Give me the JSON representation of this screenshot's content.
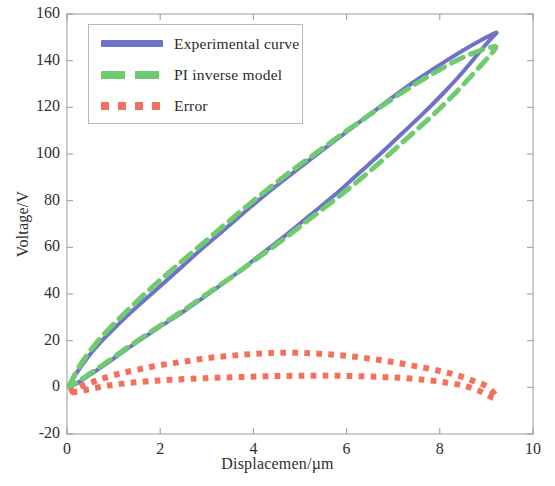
{
  "chart_data": {
    "type": "line",
    "title": "",
    "xlabel": "Displacemen/µm",
    "ylabel": "Voltage/V",
    "xlim": [
      0,
      10
    ],
    "ylim": [
      -20,
      160
    ],
    "xticks": [
      "0",
      "2",
      "4",
      "6",
      "8",
      "10"
    ],
    "xtick_values": [
      0,
      2,
      4,
      6,
      8,
      10
    ],
    "yticks": [
      "-20",
      "0",
      "20",
      "40",
      "60",
      "80",
      "100",
      "120",
      "140",
      "160"
    ],
    "ytick_values": [
      -20,
      0,
      20,
      40,
      60,
      80,
      100,
      120,
      140,
      160
    ],
    "grid": false,
    "legend_position": "upper left",
    "series": [
      {
        "name": "Experimental curve",
        "color": "#6E72C8",
        "style": "solid",
        "linewidth": 4,
        "points": [
          [
            0.05,
            0.5
          ],
          [
            0.2,
            6.0
          ],
          [
            0.45,
            13.0
          ],
          [
            0.75,
            20.0
          ],
          [
            1.1,
            27.0
          ],
          [
            1.5,
            34.5
          ],
          [
            1.95,
            42.5
          ],
          [
            2.4,
            50.5
          ],
          [
            2.9,
            59.5
          ],
          [
            3.4,
            68.0
          ],
          [
            3.95,
            77.5
          ],
          [
            4.5,
            86.5
          ],
          [
            5.05,
            95.0
          ],
          [
            5.6,
            103.5
          ],
          [
            6.1,
            111.0
          ],
          [
            6.6,
            118.5
          ],
          [
            7.1,
            126.0
          ],
          [
            7.6,
            133.0
          ],
          [
            8.1,
            139.5
          ],
          [
            8.55,
            145.0
          ],
          [
            8.9,
            149.0
          ],
          [
            9.15,
            151.5
          ],
          [
            9.22,
            152.0
          ],
          [
            9.15,
            150.5
          ],
          [
            8.95,
            146.0
          ],
          [
            8.7,
            140.0
          ],
          [
            8.4,
            133.0
          ],
          [
            8.05,
            125.5
          ],
          [
            7.65,
            117.5
          ],
          [
            7.2,
            109.0
          ],
          [
            6.75,
            100.5
          ],
          [
            6.25,
            91.5
          ],
          [
            5.75,
            82.5
          ],
          [
            5.2,
            73.5
          ],
          [
            4.65,
            64.5
          ],
          [
            4.1,
            56.0
          ],
          [
            3.55,
            47.5
          ],
          [
            3.0,
            39.5
          ],
          [
            2.5,
            32.5
          ],
          [
            2.0,
            26.0
          ],
          [
            1.55,
            20.0
          ],
          [
            1.15,
            14.5
          ],
          [
            0.8,
            9.5
          ],
          [
            0.5,
            5.5
          ],
          [
            0.28,
            2.5
          ],
          [
            0.12,
            0.8
          ],
          [
            0.05,
            0.2
          ]
        ]
      },
      {
        "name": "PI inverse model",
        "color": "#6FCB6F",
        "style": "dashed",
        "linewidth": 5,
        "points": [
          [
            0.05,
            0.8
          ],
          [
            0.25,
            8.5
          ],
          [
            0.55,
            17.0
          ],
          [
            0.9,
            25.0
          ],
          [
            1.3,
            33.0
          ],
          [
            1.75,
            41.5
          ],
          [
            2.2,
            49.5
          ],
          [
            2.7,
            58.0
          ],
          [
            3.2,
            66.5
          ],
          [
            3.7,
            75.0
          ],
          [
            4.25,
            84.0
          ],
          [
            4.8,
            92.5
          ],
          [
            5.35,
            100.5
          ],
          [
            5.9,
            108.5
          ],
          [
            6.4,
            115.5
          ],
          [
            6.9,
            122.5
          ],
          [
            7.4,
            129.0
          ],
          [
            7.9,
            135.0
          ],
          [
            8.35,
            140.0
          ],
          [
            8.75,
            143.5
          ],
          [
            9.05,
            145.5
          ],
          [
            9.2,
            146.0
          ],
          [
            9.15,
            144.0
          ],
          [
            8.95,
            139.5
          ],
          [
            8.7,
            134.0
          ],
          [
            8.4,
            127.5
          ],
          [
            8.05,
            120.5
          ],
          [
            7.65,
            113.0
          ],
          [
            7.2,
            105.0
          ],
          [
            6.75,
            97.0
          ],
          [
            6.25,
            88.5
          ],
          [
            5.75,
            80.5
          ],
          [
            5.2,
            72.0
          ],
          [
            4.65,
            63.5
          ],
          [
            4.1,
            55.5
          ],
          [
            3.55,
            47.5
          ],
          [
            3.0,
            40.0
          ],
          [
            2.5,
            33.0
          ],
          [
            2.0,
            26.5
          ],
          [
            1.55,
            20.5
          ],
          [
            1.15,
            15.0
          ],
          [
            0.8,
            10.0
          ],
          [
            0.5,
            6.0
          ],
          [
            0.28,
            3.0
          ],
          [
            0.12,
            1.0
          ],
          [
            0.05,
            0.3
          ]
        ]
      },
      {
        "name": "Error",
        "color": "#F4705A",
        "style": "dotted",
        "linewidth": 6,
        "points": [
          [
            0.05,
            -2.0
          ],
          [
            0.3,
            0.5
          ],
          [
            0.65,
            3.0
          ],
          [
            1.05,
            5.5
          ],
          [
            1.5,
            7.5
          ],
          [
            2.0,
            9.5
          ],
          [
            2.5,
            11.0
          ],
          [
            3.0,
            12.5
          ],
          [
            3.5,
            13.5
          ],
          [
            4.0,
            14.3
          ],
          [
            4.5,
            14.8
          ],
          [
            5.0,
            14.8
          ],
          [
            5.5,
            14.3
          ],
          [
            6.0,
            13.5
          ],
          [
            6.5,
            12.3
          ],
          [
            7.0,
            10.8
          ],
          [
            7.5,
            9.0
          ],
          [
            8.0,
            7.0
          ],
          [
            8.4,
            5.0
          ],
          [
            8.75,
            2.5
          ],
          [
            9.0,
            0.5
          ],
          [
            9.2,
            -3.5
          ],
          [
            9.15,
            -4.5
          ],
          [
            8.9,
            -2.0
          ],
          [
            8.55,
            0.5
          ],
          [
            8.15,
            2.0
          ],
          [
            7.7,
            3.2
          ],
          [
            7.2,
            4.0
          ],
          [
            6.7,
            4.5
          ],
          [
            6.2,
            4.8
          ],
          [
            5.7,
            5.0
          ],
          [
            5.2,
            5.0
          ],
          [
            4.7,
            4.9
          ],
          [
            4.2,
            4.7
          ],
          [
            3.7,
            4.4
          ],
          [
            3.2,
            4.1
          ],
          [
            2.7,
            3.7
          ],
          [
            2.2,
            3.2
          ],
          [
            1.75,
            2.6
          ],
          [
            1.3,
            1.8
          ],
          [
            0.9,
            0.8
          ],
          [
            0.55,
            -0.5
          ],
          [
            0.3,
            -1.5
          ],
          [
            0.1,
            -2.2
          ]
        ]
      }
    ]
  },
  "legend": {
    "entries": [
      {
        "label": "Experimental curve",
        "icon": "solid-line-swatch"
      },
      {
        "label": "PI inverse model",
        "icon": "dashed-line-swatch"
      },
      {
        "label": "Error",
        "icon": "dotted-line-swatch"
      }
    ]
  },
  "axes": {
    "x_label": "Displacemen/µm",
    "y_label": "Voltage/V"
  }
}
